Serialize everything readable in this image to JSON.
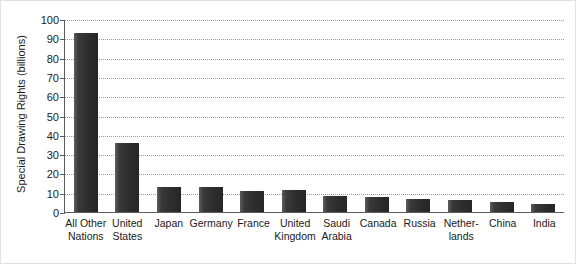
{
  "chart_data": {
    "type": "bar",
    "title": "",
    "xlabel": "",
    "ylabel": "Special Drawing Rights (billions)",
    "ylim": [
      0,
      100
    ],
    "ytick_step": 10,
    "yticks": [
      100,
      90,
      80,
      70,
      60,
      50,
      40,
      30,
      20,
      10,
      0
    ],
    "grid": true,
    "legend": "none",
    "bar_color": "#2e2e2e",
    "axis_color": "#5b5b5b",
    "gridline_color": "#9a9a9a",
    "categories": [
      "All Other Nations",
      "United States",
      "Japan",
      "Germany",
      "France",
      "United Kingdom",
      "Saudi Arabia",
      "Canada",
      "Russia",
      "Netherlands",
      "China",
      "India"
    ],
    "category_lines": [
      [
        "All Other",
        "Nations"
      ],
      [
        "United",
        "States"
      ],
      [
        "Japan"
      ],
      [
        "Germany"
      ],
      [
        "France"
      ],
      [
        "United",
        "Kingdom"
      ],
      [
        "Saudi",
        "Arabia"
      ],
      [
        "Canada"
      ],
      [
        "Russia"
      ],
      [
        "Nether-",
        "lands"
      ],
      [
        "China"
      ],
      [
        "India"
      ]
    ],
    "values": [
      93,
      36,
      13,
      13,
      11,
      11.5,
      8.5,
      8,
      7,
      6,
      5,
      4
    ]
  }
}
